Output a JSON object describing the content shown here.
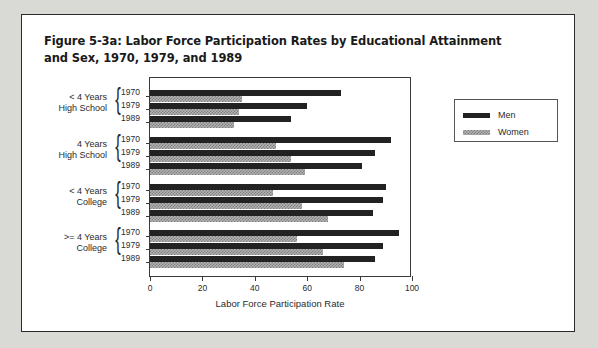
{
  "figure": {
    "title": "Figure 5-3a: Labor Force Participation Rates by Educational Attainment and Sex, 1970, 1979, and 1989"
  },
  "legend": {
    "entries": [
      {
        "label": "Men",
        "color": "#222222"
      },
      {
        "label": "Women",
        "color": "#b4b4b4"
      }
    ]
  },
  "axis": {
    "xlabel": "Labor Force Participation Rate",
    "xticks": [
      "0",
      "20",
      "40",
      "60",
      "80",
      "100"
    ]
  },
  "categories": [
    {
      "line1": "< 4 Years",
      "line2": "High School"
    },
    {
      "line1": "4 Years",
      "line2": "High School"
    },
    {
      "line1": "<  4 Years",
      "line2": "College"
    },
    {
      "line1": ">=  4 Years",
      "line2": "College"
    }
  ],
  "years": [
    "1970",
    "1979",
    "1989"
  ],
  "chart_data": {
    "type": "bar",
    "orientation": "horizontal",
    "title": "Figure 5-3a: Labor Force Participation Rates by Educational Attainment and Sex, 1970, 1979, and 1989",
    "xlabel": "Labor Force Participation Rate",
    "ylabel": "",
    "xlim": [
      0,
      100
    ],
    "xticks": [
      0,
      20,
      40,
      60,
      80,
      100
    ],
    "grid": false,
    "legend_position": "right",
    "groups": [
      "< 4 Years High School",
      "4 Years High School",
      "< 4 Years College",
      ">= 4 Years College"
    ],
    "years": [
      "1970",
      "1979",
      "1989"
    ],
    "series": [
      {
        "name": "Men",
        "color": "#222222",
        "values": {
          "< 4 Years High School": [
            73,
            60,
            54
          ],
          "4 Years High School": [
            92,
            86,
            81
          ],
          "< 4 Years College": [
            90,
            89,
            85
          ],
          ">= 4 Years College": [
            95,
            89,
            86
          ]
        }
      },
      {
        "name": "Women",
        "color": "#b4b4b4",
        "values": {
          "< 4 Years High School": [
            35,
            34,
            32
          ],
          "4 Years High School": [
            48,
            54,
            59
          ],
          "< 4 Years College": [
            47,
            58,
            68
          ],
          ">= 4 Years College": [
            56,
            66,
            74
          ]
        }
      }
    ]
  }
}
